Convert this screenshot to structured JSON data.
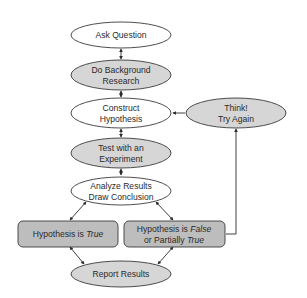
{
  "diagram": {
    "colors": {
      "filled": "#d6d6d6",
      "outline": "#3a3a3a",
      "empty": "#ffffff",
      "box": "#bdbdbd"
    },
    "nodes": {
      "ask_question": {
        "line1": "Ask Question"
      },
      "background": {
        "line1": "Do Background",
        "line2": "Research"
      },
      "construct": {
        "line1": "Construct",
        "line2": "Hypothesis"
      },
      "think": {
        "line1": "Think!",
        "line2": "Try Again"
      },
      "test": {
        "line1": "Test with an",
        "line2": "Experiment"
      },
      "analyze": {
        "line1": "Analyze Results",
        "line2": "Draw Conclusion"
      },
      "true_box": {
        "prefix": "Hypothesis is ",
        "italic": "True"
      },
      "false_box": {
        "prefix": "Hypothesis is ",
        "italic1": "False",
        "line2_prefix": "or Partially ",
        "italic2": "True"
      },
      "report": {
        "line1": "Report Results"
      }
    }
  }
}
